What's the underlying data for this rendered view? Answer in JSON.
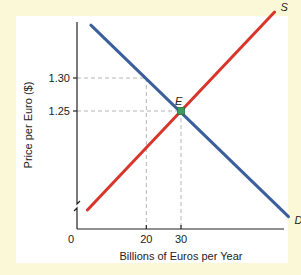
{
  "chart_data": {
    "type": "line",
    "title": "",
    "xlabel": "Billions of Euros per Year",
    "ylabel": "Price per Euro ($)",
    "x_ticks": [
      {
        "value": 0,
        "label": "0"
      },
      {
        "value": 20,
        "label": "20"
      },
      {
        "value": 30,
        "label": "30"
      }
    ],
    "y_ticks": [
      {
        "value": 1.3,
        "label": "1.30"
      },
      {
        "value": 1.25,
        "label": "1.25"
      }
    ],
    "y_axis_break": true,
    "grid": false,
    "series": [
      {
        "name": "S",
        "label": "S",
        "color": "#d9352a",
        "kind": "supply",
        "points": [
          [
            3,
            1.1
          ],
          [
            57,
            1.4
          ]
        ]
      },
      {
        "name": "D",
        "label": "D",
        "color": "#3b5f9c",
        "kind": "demand",
        "points": [
          [
            4,
            1.38
          ],
          [
            61,
            1.09
          ]
        ]
      }
    ],
    "guides": [
      {
        "x": 20,
        "y": 1.3
      },
      {
        "x": 30,
        "y": 1.25
      }
    ],
    "annotations": [
      {
        "label": "E",
        "x": 30,
        "y": 1.25,
        "marker_color": "#3a9a5b"
      }
    ]
  }
}
